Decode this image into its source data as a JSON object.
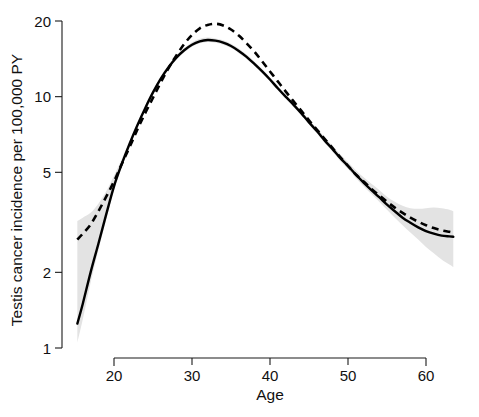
{
  "chart_data": {
    "type": "line",
    "title": "",
    "subtitle": "",
    "xlabel": "Age",
    "ylabel": "Testis cancer incidence per 100,000 PY",
    "xlim": [
      15.3,
      63.5
    ],
    "ylim": [
      1,
      22
    ],
    "yscale": "log",
    "xscale": "linear",
    "grid": false,
    "legend": "none",
    "xticks": [
      20,
      30,
      40,
      50,
      60
    ],
    "xticklabels": [
      "20",
      "30",
      "40",
      "50",
      "60"
    ],
    "yticks": [
      1,
      2,
      5,
      10,
      20
    ],
    "yticklabels": [
      "1",
      "2",
      "5",
      "10",
      "20"
    ],
    "annotations": [],
    "series": [
      {
        "name": "solid-curve",
        "style": "solid",
        "color": "#000000",
        "x": [
          15.3,
          16,
          17,
          18,
          19,
          20,
          21,
          22,
          23,
          24,
          25,
          26,
          27,
          28,
          29,
          30,
          31,
          32,
          33,
          34,
          35,
          36,
          37,
          38,
          39,
          40,
          41,
          42,
          43,
          44,
          45,
          46,
          47,
          48,
          49,
          50,
          51,
          52,
          53,
          54,
          55,
          56,
          57,
          58,
          59,
          60,
          61,
          62,
          63,
          63.5
        ],
        "values": [
          1.25,
          1.5,
          2.0,
          2.6,
          3.4,
          4.4,
          5.4,
          6.5,
          7.7,
          9.0,
          10.4,
          11.8,
          13.1,
          14.3,
          15.3,
          16.1,
          16.6,
          16.8,
          16.7,
          16.4,
          15.9,
          15.2,
          14.4,
          13.5,
          12.6,
          11.7,
          10.8,
          10.0,
          9.3,
          8.6,
          7.9,
          7.3,
          6.7,
          6.2,
          5.7,
          5.3,
          4.9,
          4.55,
          4.25,
          3.98,
          3.72,
          3.5,
          3.3,
          3.15,
          3.02,
          2.92,
          2.85,
          2.8,
          2.78,
          2.77
        ]
      },
      {
        "name": "dashed-curve",
        "style": "dashed",
        "color": "#000000",
        "x": [
          15.3,
          16,
          17,
          18,
          19,
          20,
          21,
          22,
          23,
          24,
          25,
          26,
          27,
          28,
          29,
          30,
          31,
          32,
          33,
          34,
          35,
          36,
          37,
          38,
          39,
          40,
          41,
          42,
          43,
          44,
          45,
          46,
          47,
          48,
          49,
          50,
          51,
          52,
          53,
          54,
          55,
          56,
          57,
          58,
          59,
          60,
          61,
          62,
          63,
          63.5
        ],
        "values": [
          2.7,
          2.85,
          3.1,
          3.5,
          4.0,
          4.6,
          5.4,
          6.3,
          7.4,
          8.6,
          9.9,
          11.4,
          13.0,
          14.6,
          16.2,
          17.6,
          18.7,
          19.3,
          19.5,
          19.2,
          18.5,
          17.5,
          16.3,
          15.1,
          13.8,
          12.6,
          11.5,
          10.5,
          9.6,
          8.8,
          8.05,
          7.4,
          6.8,
          6.25,
          5.75,
          5.3,
          4.9,
          4.6,
          4.3,
          4.05,
          3.82,
          3.62,
          3.45,
          3.3,
          3.18,
          3.08,
          3.0,
          2.94,
          2.9,
          2.88
        ]
      }
    ],
    "confidence_band": {
      "name": "confidence-interval",
      "color": "#e3e3e3",
      "x": [
        15.3,
        16,
        17,
        18,
        19,
        20,
        21,
        22,
        23,
        24,
        25,
        26,
        27,
        28,
        29,
        30,
        31,
        32,
        33,
        34,
        35,
        36,
        37,
        38,
        39,
        40,
        41,
        42,
        43,
        44,
        45,
        46,
        47,
        48,
        49,
        50,
        51,
        52,
        53,
        54,
        55,
        56,
        57,
        58,
        59,
        60,
        61,
        62,
        63,
        63.5
      ],
      "lower": [
        1.05,
        1.3,
        1.82,
        2.45,
        3.25,
        4.25,
        5.25,
        6.35,
        7.55,
        8.85,
        10.2,
        11.6,
        12.9,
        14.1,
        15.0,
        15.8,
        16.3,
        16.5,
        16.4,
        16.1,
        15.6,
        14.9,
        14.15,
        13.25,
        12.4,
        11.5,
        10.6,
        9.85,
        9.1,
        8.45,
        7.75,
        7.15,
        6.55,
        6.05,
        5.55,
        5.15,
        4.75,
        4.4,
        4.1,
        3.82,
        3.55,
        3.3,
        3.08,
        2.88,
        2.7,
        2.52,
        2.38,
        2.25,
        2.15,
        2.1
      ],
      "upper": [
        3.2,
        3.3,
        3.45,
        3.75,
        4.2,
        4.85,
        5.65,
        6.6,
        7.85,
        9.15,
        10.6,
        12.05,
        13.4,
        14.6,
        15.6,
        16.45,
        17.0,
        17.2,
        17.05,
        16.75,
        16.25,
        15.55,
        14.7,
        13.8,
        12.85,
        11.95,
        11.05,
        10.2,
        9.5,
        8.8,
        8.1,
        7.5,
        6.9,
        6.4,
        5.9,
        5.5,
        5.1,
        4.78,
        4.5,
        4.25,
        4.0,
        3.82,
        3.68,
        3.6,
        3.58,
        3.6,
        3.62,
        3.6,
        3.55,
        3.5
      ]
    }
  }
}
